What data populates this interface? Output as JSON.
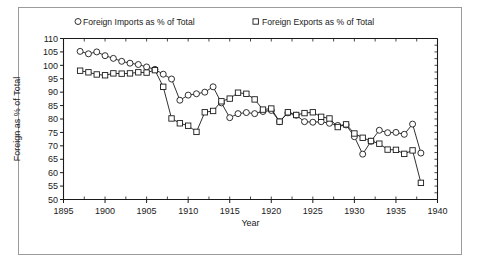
{
  "chart_data": {
    "type": "line",
    "title": "",
    "xlabel": "Year",
    "ylabel": "Foreign as % of Total",
    "xlim": [
      1895,
      1940
    ],
    "ylim": [
      50,
      110
    ],
    "xticks": [
      1895,
      1900,
      1905,
      1910,
      1915,
      1920,
      1925,
      1930,
      1935,
      1940
    ],
    "yticks": [
      50,
      55,
      60,
      65,
      70,
      75,
      80,
      85,
      90,
      95,
      100,
      105,
      110
    ],
    "grid": false,
    "legend_position": "top",
    "series": [
      {
        "name": "Foreign Imports as % of Total",
        "marker": "circle",
        "x": [
          1897,
          1898,
          1899,
          1900,
          1901,
          1902,
          1903,
          1904,
          1905,
          1906,
          1907,
          1908,
          1909,
          1910,
          1911,
          1912,
          1913,
          1914,
          1915,
          1916,
          1917,
          1918,
          1919,
          1920,
          1921,
          1922,
          1923,
          1924,
          1925,
          1926,
          1927,
          1928,
          1929,
          1930,
          1931,
          1932,
          1933,
          1934,
          1935,
          1936,
          1937,
          1938
        ],
        "y": [
          105.2,
          104.3,
          105.0,
          103.6,
          102.6,
          101.5,
          100.8,
          100.3,
          99.4,
          98.5,
          96.7,
          94.9,
          87.0,
          88.9,
          89.4,
          90.0,
          92.0,
          86.0,
          80.5,
          82.0,
          82.4,
          82.0,
          82.8,
          83.2,
          79.0,
          82.3,
          81.4,
          79.0,
          78.8,
          79.0,
          78.4,
          77.6,
          77.8,
          73.4,
          66.9,
          71.7,
          75.8,
          74.9,
          75.0,
          74.3,
          78.1,
          67.3
        ]
      },
      {
        "name": "Foreign Exports as % of Total",
        "marker": "square",
        "x": [
          1897,
          1898,
          1899,
          1900,
          1901,
          1902,
          1903,
          1904,
          1905,
          1906,
          1907,
          1908,
          1909,
          1910,
          1911,
          1912,
          1913,
          1914,
          1915,
          1916,
          1917,
          1918,
          1919,
          1920,
          1921,
          1922,
          1923,
          1924,
          1925,
          1926,
          1927,
          1928,
          1929,
          1930,
          1931,
          1932,
          1933,
          1934,
          1935,
          1936,
          1937,
          1938
        ],
        "y": [
          98.0,
          97.4,
          96.6,
          96.3,
          97.0,
          96.9,
          97.0,
          97.4,
          97.3,
          98.2,
          92.0,
          80.2,
          78.4,
          77.5,
          75.2,
          82.5,
          83.0,
          86.6,
          87.6,
          89.8,
          89.4,
          87.3,
          83.5,
          83.9,
          79.0,
          82.5,
          81.5,
          82.2,
          82.5,
          80.8,
          80.2,
          77.0,
          78.0,
          74.6,
          73.0,
          71.8,
          70.8,
          68.6,
          68.5,
          67.0,
          68.3,
          56.2
        ]
      }
    ]
  },
  "legend": {
    "entries": [
      {
        "marker": "circle",
        "label": "Foreign Imports as % of Total"
      },
      {
        "marker": "square",
        "label": "Foreign Exports as % of Total"
      }
    ]
  },
  "colors": {
    "ink": "#1a1a1a",
    "frame": "#9b9b9b",
    "background": "#ffffff",
    "marker_fill": "#ffffff"
  }
}
